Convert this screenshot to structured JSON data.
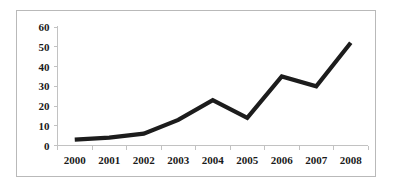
{
  "chart_data": {
    "type": "line",
    "title": "",
    "subtitle": "",
    "xlabel": "",
    "ylabel": "",
    "categories": [
      "2000",
      "2001",
      "2002",
      "2003",
      "2004",
      "2005",
      "2006",
      "2007",
      "2008"
    ],
    "values": [
      3,
      4,
      6,
      13,
      23,
      14,
      35,
      30,
      52
    ],
    "series": [
      {
        "name": "",
        "values": [
          3,
          4,
          6,
          13,
          23,
          14,
          35,
          30,
          52
        ]
      }
    ],
    "ylim": [
      0,
      60
    ],
    "yticks": [
      0,
      10,
      20,
      30,
      40,
      50,
      60
    ],
    "ytick_labels": [
      "0",
      "10",
      "20",
      "30",
      "40",
      "50",
      "60"
    ],
    "xtick_labels": [
      "2000",
      "2001",
      "2002",
      "2003",
      "2004",
      "2005",
      "2006",
      "2007",
      "2008"
    ],
    "grid": false,
    "legend": false,
    "legend_position": "none",
    "markers": false,
    "colors": {
      "line": "#1c1c1c",
      "axis": "#c2c2c2",
      "frame": "#b9b9b9",
      "background": "#ffffff",
      "text": "#1a1a1a"
    }
  }
}
